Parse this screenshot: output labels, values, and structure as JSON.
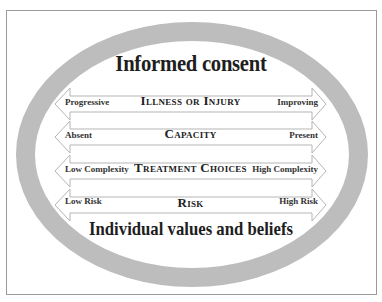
{
  "diagram": {
    "title": "Informed consent",
    "footer": "Individual values and beliefs",
    "colors": {
      "ring": "#bdbdbd",
      "arrow_stroke": "#b5b5b5",
      "arrow_fill": "#ffffff",
      "frame": "#9a9a9a",
      "text": "#1e1e1e"
    },
    "spectra": [
      {
        "name": "Illness or Injury",
        "left": "Progressive",
        "right": "Improving"
      },
      {
        "name": "Capacity",
        "left": "Absent",
        "right": "Present"
      },
      {
        "name": "Treatment Choices",
        "left": "Low Complexity",
        "right": "High Complexity"
      },
      {
        "name": "Risk",
        "left": "Low Risk",
        "right": "High Risk"
      }
    ]
  }
}
